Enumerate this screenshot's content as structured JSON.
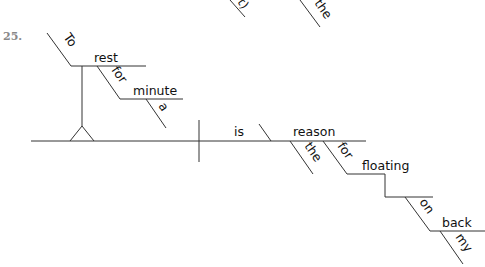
{
  "exercise": {
    "number": "25."
  },
  "fragments_top": {
    "left": "t)",
    "right": "the"
  },
  "diagram": {
    "subject_phrase": {
      "preposition_infinitive": "To",
      "verb": "rest",
      "prep": "for",
      "prep_object": "minute",
      "article": "a"
    },
    "predicate": {
      "verb": "is",
      "predicate_nominative": "reason",
      "article": "the",
      "prep": "for",
      "gerund": "floating",
      "gerund_prep": "on",
      "gerund_prep_object": "back",
      "possessive": "my"
    }
  }
}
